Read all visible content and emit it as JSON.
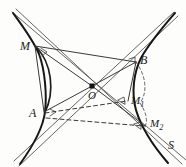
{
  "figure": {
    "kind": "geometry-diagram",
    "background_color": "#fdfdfb",
    "ink_color": "#161616",
    "labels": [
      {
        "id": "M",
        "text": "M",
        "sub": "",
        "x": 20,
        "y": 40
      },
      {
        "id": "B",
        "text": "B",
        "sub": "",
        "x": 140,
        "y": 54
      },
      {
        "id": "O",
        "text": "O",
        "sub": "",
        "x": 88,
        "y": 90
      },
      {
        "id": "A",
        "text": "A",
        "sub": "",
        "x": 29,
        "y": 107
      },
      {
        "id": "M1",
        "text": "M",
        "sub": "1",
        "x": 131,
        "y": 95
      },
      {
        "id": "M2",
        "text": "M",
        "sub": "2",
        "x": 150,
        "y": 118
      },
      {
        "id": "S",
        "text": "S",
        "sub": "",
        "x": 168,
        "y": 139
      }
    ],
    "points": {
      "M": {
        "x": 35,
        "y": 46
      },
      "B": {
        "x": 136,
        "y": 62
      },
      "O": {
        "x": 92,
        "y": 86
      },
      "A": {
        "x": 44,
        "y": 112
      },
      "M1": {
        "x": 128,
        "y": 101
      },
      "M2": {
        "x": 145,
        "y": 126
      },
      "S": {
        "x": 172,
        "y": 146
      }
    },
    "elements": [
      "left-hyperbola-branch",
      "right-hyperbola-branch",
      "asymptote-major",
      "asymptote-minor",
      "chord-M-B",
      "chord-M-A",
      "chord-A-M2",
      "chord-A-M1",
      "chord-B-M1",
      "chord-B-M2",
      "arc-left-lens",
      "arc-right-dashed",
      "center-node-O"
    ]
  }
}
